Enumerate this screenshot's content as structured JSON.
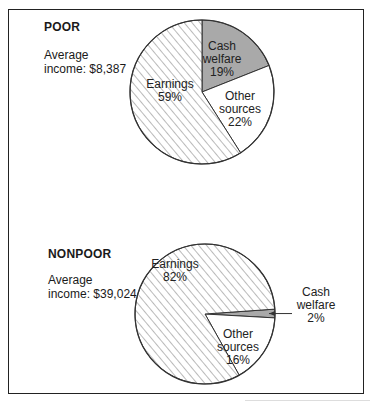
{
  "chart_data": [
    {
      "type": "pie",
      "group": "POOR",
      "title": "POOR",
      "subtitle_line1": "Average",
      "subtitle_line2": "income: $8,387",
      "average_income": 8387,
      "slices": [
        {
          "label": "Cash welfare",
          "value": 19,
          "label_lines": [
            "Cash",
            "welfare",
            "19%"
          ],
          "fill": "gray"
        },
        {
          "label": "Other sources",
          "value": 22,
          "label_lines": [
            "Other",
            "sources",
            "22%"
          ],
          "fill": "white"
        },
        {
          "label": "Earnings",
          "value": 59,
          "label_lines": [
            "Earnings",
            "59%"
          ],
          "fill": "hatch"
        }
      ]
    },
    {
      "type": "pie",
      "group": "NONPOOR",
      "title": "NONPOOR",
      "subtitle_line1": "Average",
      "subtitle_line2": "income: $39,024",
      "average_income": 39024,
      "slices": [
        {
          "label": "Cash welfare",
          "value": 2,
          "label_lines": [
            "Cash",
            "welfare",
            "2%"
          ],
          "fill": "gray",
          "callout": true
        },
        {
          "label": "Other sources",
          "value": 16,
          "label_lines": [
            "Other",
            "sources",
            "16%"
          ],
          "fill": "white"
        },
        {
          "label": "Earnings",
          "value": 82,
          "label_lines": [
            "Earnings",
            "82%"
          ],
          "fill": "hatch"
        }
      ]
    }
  ],
  "colors": {
    "gray_fill": "#a9a9a9",
    "hatch_line": "#555555",
    "outline": "#333333"
  }
}
